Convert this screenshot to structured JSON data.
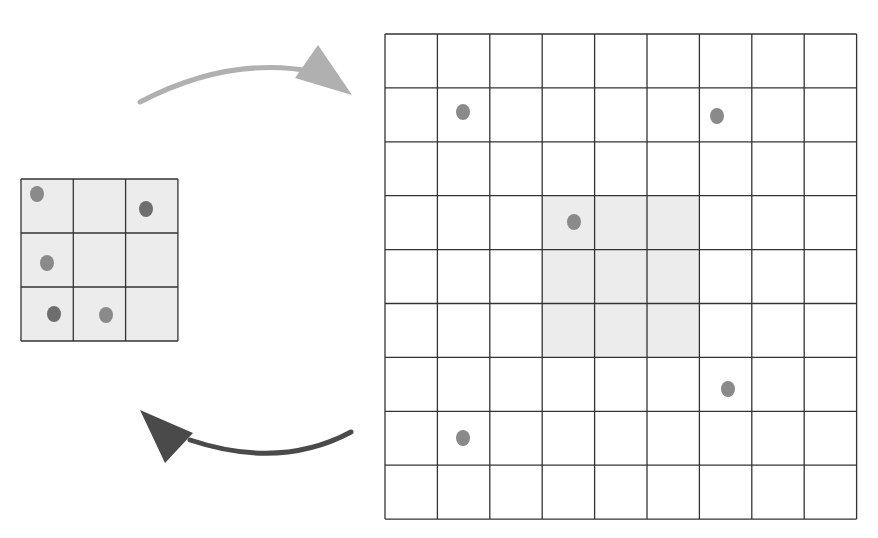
{
  "colors": {
    "background": "#ffffff",
    "grid_line": "#333333",
    "small_grid_fill": "#ececec",
    "highlight_fill": "#ececec",
    "dot": "#8a8a8a",
    "dot_dark": "#6e6e6e",
    "arrow_top": "#b0b0b0",
    "arrow_bottom": "#4a4a4a"
  },
  "small_grid": {
    "rows": 3,
    "cols": 3,
    "x": 21,
    "y": 179,
    "cell_w": 52.3,
    "cell_h": 54,
    "dots": [
      {
        "row": 0,
        "col": 0,
        "cx": 37,
        "cy": 194,
        "shade": "dot"
      },
      {
        "row": 0,
        "col": 2,
        "cx": 146,
        "cy": 209,
        "shade": "dot_dark"
      },
      {
        "row": 1,
        "col": 0,
        "cx": 47,
        "cy": 263,
        "shade": "dot"
      },
      {
        "row": 2,
        "col": 0,
        "cx": 54,
        "cy": 314,
        "shade": "dot_dark"
      },
      {
        "row": 2,
        "col": 1,
        "cx": 106,
        "cy": 315,
        "shade": "dot"
      }
    ]
  },
  "large_grid": {
    "rows": 9,
    "cols": 9,
    "x": 385,
    "y": 34,
    "cell_w": 52.4,
    "cell_h": 53.9,
    "highlight": {
      "row": 3,
      "col": 3,
      "rows": 3,
      "cols": 3
    },
    "dots": [
      {
        "row": 1,
        "col": 1,
        "cx": 463,
        "cy": 112
      },
      {
        "row": 1,
        "col": 6,
        "cx": 717,
        "cy": 116
      },
      {
        "row": 3,
        "col": 3,
        "cx": 574,
        "cy": 222
      },
      {
        "row": 6,
        "col": 6,
        "cx": 728,
        "cy": 389
      },
      {
        "row": 7,
        "col": 1,
        "cx": 463,
        "cy": 438
      }
    ]
  },
  "arrows": [
    {
      "name": "expand-arrow",
      "direction": "small-to-large",
      "from": [
        140,
        100
      ],
      "to": [
        352,
        95
      ],
      "color": "arrow_top"
    },
    {
      "name": "contract-arrow",
      "direction": "large-to-small",
      "from": [
        350,
        432
      ],
      "to": [
        140,
        412
      ],
      "color": "arrow_bottom"
    }
  ]
}
